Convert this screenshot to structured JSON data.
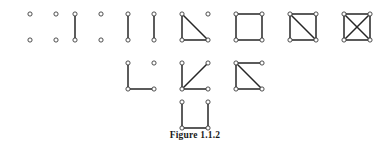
{
  "figure": {
    "caption": "Figure 1.1.2",
    "background_color": "#ffffff",
    "edge_color": "#262626",
    "vertex_fill_color": "#ffffff",
    "vertex_stroke_color": "#3a3a3a",
    "vertex_radius": 2.1,
    "edge_width": 1.5,
    "width": 390,
    "height": 150
  },
  "chart_data": {
    "type": "diagram",
    "title": "Figure 1.1.2",
    "vertex_layout": {
      "positions": [
        "top-left",
        "top-right",
        "bottom-left",
        "bottom-right"
      ],
      "cell_width": 26,
      "cell_height": 26
    },
    "rows": [
      {
        "row_index": 0,
        "y_top": 14,
        "graphs": [
          {
            "name": "empty-graph",
            "x_left": 30,
            "edges": [],
            "edge_count": 0,
            "vertices": 4
          },
          {
            "name": "one-edge-graph",
            "x_left": 75,
            "edges": [
              [
                0,
                2
              ]
            ],
            "edge_count": 1,
            "vertices": 4
          },
          {
            "name": "perfect-matching-graph",
            "x_left": 128,
            "edges": [
              [
                0,
                2
              ],
              [
                1,
                3
              ]
            ],
            "edge_count": 2,
            "vertices": 4
          },
          {
            "name": "triangle-plus-isolated-vertex",
            "x_left": 182,
            "edges": [
              [
                0,
                2
              ],
              [
                2,
                3
              ],
              [
                0,
                3
              ]
            ],
            "edge_count": 3,
            "vertices": 4
          },
          {
            "name": "cycle-four-graph",
            "x_left": 236,
            "edges": [
              [
                0,
                1
              ],
              [
                1,
                3
              ],
              [
                3,
                2
              ],
              [
                2,
                0
              ]
            ],
            "edge_count": 4,
            "vertices": 4
          },
          {
            "name": "diamond-graph",
            "x_left": 290,
            "edges": [
              [
                0,
                1
              ],
              [
                1,
                3
              ],
              [
                3,
                2
              ],
              [
                2,
                0
              ],
              [
                0,
                3
              ]
            ],
            "edge_count": 5,
            "vertices": 4
          },
          {
            "name": "complete-graph-k4",
            "x_left": 344,
            "edges": [
              [
                0,
                1
              ],
              [
                1,
                3
              ],
              [
                3,
                2
              ],
              [
                2,
                0
              ],
              [
                0,
                3
              ],
              [
                1,
                2
              ]
            ],
            "edge_count": 6,
            "vertices": 4
          }
        ]
      },
      {
        "row_index": 1,
        "y_top": 63,
        "graphs": [
          {
            "name": "path-three-plus-isolated-vertex",
            "x_left": 128,
            "edges": [
              [
                0,
                2
              ],
              [
                2,
                3
              ]
            ],
            "edge_count": 2,
            "vertices": 4
          },
          {
            "name": "star-graph-claw",
            "x_left": 182,
            "edges": [
              [
                2,
                0
              ],
              [
                2,
                1
              ],
              [
                2,
                3
              ]
            ],
            "edge_count": 3,
            "vertices": 4
          },
          {
            "name": "paw-graph",
            "x_left": 236,
            "edges": [
              [
                0,
                1
              ],
              [
                0,
                2
              ],
              [
                2,
                3
              ],
              [
                0,
                3
              ]
            ],
            "edge_count": 4,
            "vertices": 4
          }
        ]
      },
      {
        "row_index": 2,
        "y_top": 102,
        "graphs": [
          {
            "name": "path-four-graph",
            "x_left": 182,
            "edges": [
              [
                0,
                2
              ],
              [
                2,
                3
              ],
              [
                3,
                1
              ]
            ],
            "edge_count": 3,
            "vertices": 4
          }
        ]
      }
    ]
  }
}
